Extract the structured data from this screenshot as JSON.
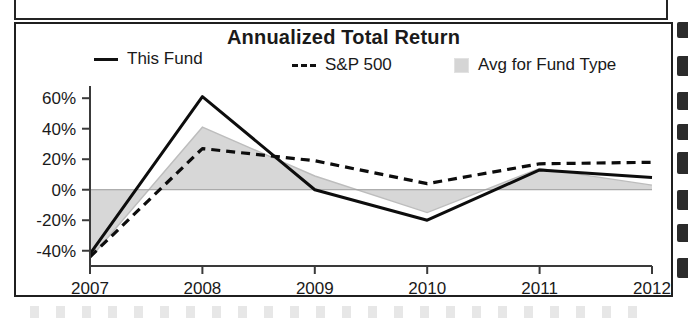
{
  "chart_panel": {
    "title": "Annualized Total Return",
    "legend": [
      {
        "label": "This Fund",
        "marker": "solid-line-swatch"
      },
      {
        "label": "S&P 500",
        "marker": "dashed-line-swatch"
      },
      {
        "label": "Avg for Fund Type",
        "marker": "shaded-area-swatch"
      }
    ],
    "axis_note": "YTD"
  },
  "chart_data": {
    "type": "line",
    "title": "Annualized Total Return",
    "xlabel": "",
    "ylabel": "",
    "categories": [
      "2007",
      "2008",
      "2009",
      "2010",
      "2011",
      "2012"
    ],
    "x_tick_labels": [
      "2007",
      "2008",
      "2009",
      "2010",
      "2011",
      "2012"
    ],
    "x_axis_note": "YTD",
    "y_tick_labels": [
      "60%",
      "40%",
      "20%",
      "0%",
      "-20%",
      "-40%"
    ],
    "y_ticks": [
      60,
      40,
      20,
      0,
      -20,
      -40
    ],
    "ylim": [
      -50,
      68
    ],
    "grid": false,
    "zero_line": true,
    "legend_position": "top",
    "series": [
      {
        "name": "This Fund",
        "style": "solid",
        "color": "#0d0d0d",
        "values": [
          -42,
          61,
          0,
          -20,
          13,
          8
        ]
      },
      {
        "name": "S&P 500",
        "style": "dashed",
        "color": "#0d0d0d",
        "values": [
          -44,
          27,
          19,
          4,
          17,
          18
        ]
      },
      {
        "name": "Avg for Fund Type",
        "style": "filled-area",
        "color": "#d7d7d7",
        "values": [
          -45,
          41,
          9,
          -15,
          14,
          3
        ]
      }
    ]
  }
}
